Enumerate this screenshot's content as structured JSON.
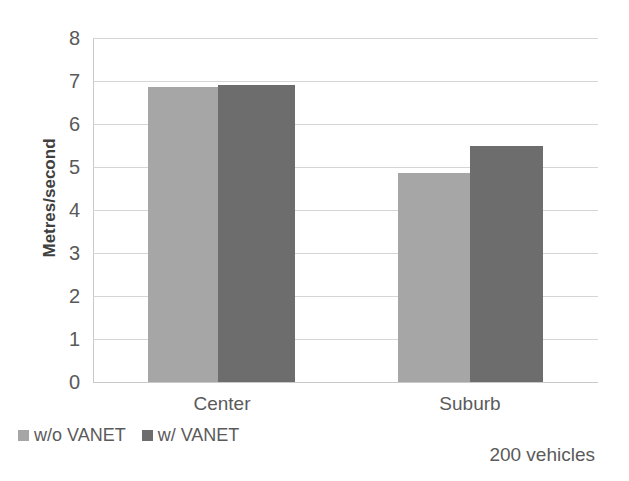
{
  "chart_data": {
    "type": "bar",
    "title": "",
    "subtitle": "",
    "xlabel": "",
    "ylabel": "Metres/second",
    "categories": [
      "Center",
      "Suburb"
    ],
    "series": [
      {
        "name": "w/o VANET",
        "values": [
          6.85,
          4.85
        ],
        "color": "#a6a6a6"
      },
      {
        "name": "w/ VANET",
        "values": [
          6.9,
          5.48
        ],
        "color": "#6d6d6d"
      }
    ],
    "ylim": [
      0,
      8
    ],
    "ytick_step": 1,
    "yticks": [
      "8",
      "7",
      "6",
      "5",
      "4",
      "3",
      "2",
      "1",
      "0"
    ],
    "grid": "horizontal",
    "legend_position": "bottom-left",
    "annotations": [
      "200 vehicles"
    ]
  },
  "axis": {
    "y_title": "Metres/second",
    "y_tick_8": "8",
    "y_tick_7": "7",
    "y_tick_6": "6",
    "y_tick_5": "5",
    "y_tick_4": "4",
    "y_tick_3": "3",
    "y_tick_2": "2",
    "y_tick_1": "1",
    "y_tick_0": "0"
  },
  "categories": {
    "first": "Center",
    "second": "Suburb"
  },
  "legend": {
    "entry_one": "w/o VANET",
    "entry_two": "w/ VANET"
  },
  "caption": {
    "text": "200 vehicles"
  },
  "colors": {
    "series_light": "#a6a6a6",
    "series_dark": "#6d6d6d",
    "gridline": "#d5d5d5",
    "text": "#5a5a5a",
    "background": "#ffffff"
  }
}
